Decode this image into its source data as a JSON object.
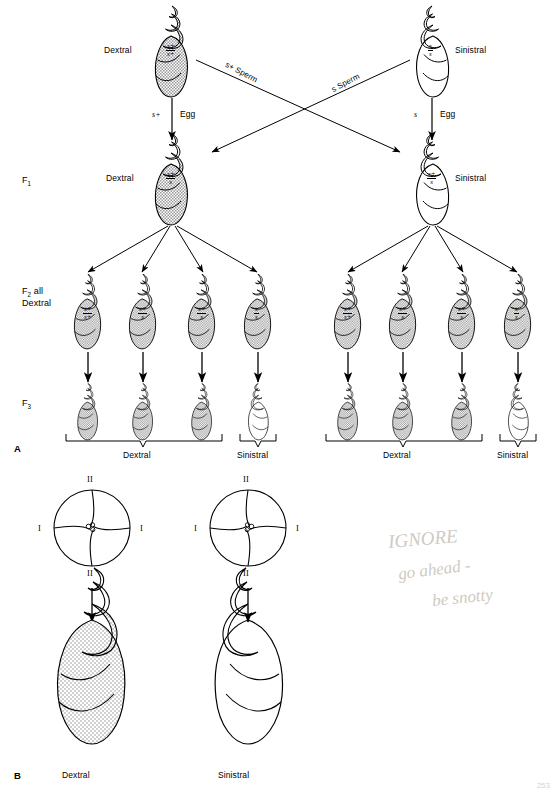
{
  "figure": {
    "panel_a_label": "A",
    "panel_b_label": "B",
    "page_number": "253"
  },
  "generations": {
    "f1": "F1",
    "f2": "F2 all Dextral",
    "f2_line1": "F2 all",
    "f2_line2": "Dextral",
    "f3": "F3"
  },
  "phenotypes": {
    "dextral": "Dextral",
    "sinistral": "Sinistral"
  },
  "genotypes": {
    "homozygous_wild": {
      "num": "s+",
      "den": "s+"
    },
    "heterozygous": {
      "num": "s+",
      "den": "s"
    },
    "homozygous_mutant": {
      "num": "s",
      "den": "s"
    }
  },
  "crosses": {
    "egg_left": "s+",
    "egg_left_label": "Egg",
    "egg_right": "s",
    "egg_right_label": "Egg",
    "sperm_left": "s+ Sperm",
    "sperm_right": "s Sperm"
  },
  "parents": [
    {
      "side": "left",
      "phenotype": "Dextral",
      "genotype_num": "s+",
      "genotype_den": "s+",
      "shaded": true
    },
    {
      "side": "right",
      "phenotype": "Sinistral",
      "genotype_num": "s",
      "genotype_den": "s",
      "shaded": false
    }
  ],
  "f1_row": [
    {
      "side": "left",
      "phenotype": "Dextral",
      "genotype_num": "s+",
      "genotype_den": "s",
      "shaded": true
    },
    {
      "side": "right",
      "phenotype": "Sinistral",
      "genotype_num": "s+",
      "genotype_den": "s",
      "shaded": false
    }
  ],
  "f2_left": [
    {
      "num": "s+",
      "den": "s+",
      "shaded": true
    },
    {
      "num": "s+",
      "den": "s",
      "shaded": true
    },
    {
      "num": "s+",
      "den": "s",
      "shaded": true
    },
    {
      "num": "s",
      "den": "s",
      "shaded": true
    }
  ],
  "f2_right": [
    {
      "num": "s+",
      "den": "s+",
      "shaded": true
    },
    {
      "num": "s+",
      "den": "s",
      "shaded": true
    },
    {
      "num": "s+",
      "den": "s",
      "shaded": true
    },
    {
      "num": "s",
      "den": "s",
      "shaded": true
    }
  ],
  "f3_left": [
    {
      "shaded": true
    },
    {
      "shaded": true
    },
    {
      "shaded": true
    },
    {
      "shaded": false
    }
  ],
  "f3_right": [
    {
      "shaded": true
    },
    {
      "shaded": true
    },
    {
      "shaded": true
    },
    {
      "shaded": false
    }
  ],
  "f3_brackets": {
    "left_dextral": "Dextral",
    "left_sinistral": "Sinistral",
    "right_dextral": "Dextral",
    "right_sinistral": "Sinistral"
  },
  "panel_b": {
    "embryos": [
      {
        "side": "left",
        "chirality": "dextral",
        "labels": {
          "top": "II",
          "bottom": "II",
          "left": "I",
          "right": "I"
        }
      },
      {
        "side": "right",
        "chirality": "sinistral",
        "labels": {
          "top": "II",
          "bottom": "II",
          "left": "I",
          "right": "I"
        }
      }
    ],
    "adults": [
      {
        "side": "left",
        "label": "Dextral",
        "stippled": true
      },
      {
        "side": "right",
        "label": "Sinistral",
        "stippled": false
      }
    ]
  },
  "handwriting": {
    "line1": "IGNORE",
    "line2": "go ahead -",
    "line3": "be snotty"
  }
}
